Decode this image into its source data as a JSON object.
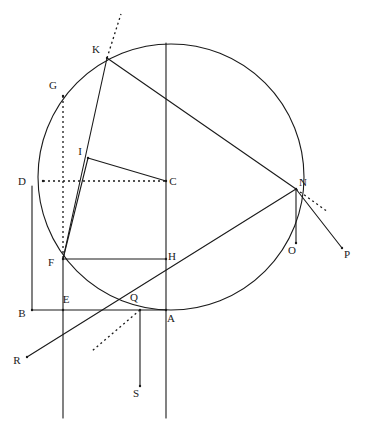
{
  "figure": {
    "width": 367,
    "height": 432,
    "background": "#ffffff",
    "stroke_color": "#1a1a1a",
    "label_color": "#1a1a1a",
    "stroke_width": 1.1
  },
  "circle": {
    "name": "main-circle",
    "cx": 171,
    "cy": 177,
    "r": 133
  },
  "points": [
    {
      "id": "A",
      "label": "A",
      "x": 166,
      "y": 310,
      "label_x": 171,
      "label_y": 322
    },
    {
      "id": "B",
      "label": "B",
      "x": 32,
      "y": 310,
      "label_x": 22,
      "label_y": 317
    },
    {
      "id": "C",
      "label": "C",
      "x": 166,
      "y": 181,
      "label_x": 173,
      "label_y": 185
    },
    {
      "id": "D",
      "label": "D",
      "x": 43,
      "y": 181,
      "label_x": 22,
      "label_y": 185
    },
    {
      "id": "E",
      "label": "E",
      "x": 63,
      "y": 310,
      "label_x": 66,
      "label_y": 303
    },
    {
      "id": "F",
      "label": "F",
      "x": 63,
      "y": 259,
      "label_x": 51,
      "label_y": 266
    },
    {
      "id": "G",
      "label": "G",
      "x": 63,
      "y": 96,
      "label_x": 53,
      "label_y": 89
    },
    {
      "id": "H",
      "label": "H",
      "x": 166,
      "y": 259,
      "label_x": 172,
      "label_y": 260
    },
    {
      "id": "I",
      "label": "I",
      "x": 88,
      "y": 158,
      "label_x": 80,
      "label_y": 155
    },
    {
      "id": "K",
      "label": "K",
      "x": 107,
      "y": 58,
      "label_x": 96,
      "label_y": 53
    },
    {
      "id": "N",
      "label": "N",
      "x": 296,
      "y": 189,
      "label_x": 303,
      "label_y": 186
    },
    {
      "id": "O",
      "label": "O",
      "x": 296,
      "y": 243,
      "label_x": 292,
      "label_y": 254
    },
    {
      "id": "P",
      "label": "P",
      "x": 342,
      "y": 248,
      "label_x": 347,
      "label_y": 258
    },
    {
      "id": "Q",
      "label": "Q",
      "x": 140,
      "y": 310,
      "label_x": 134,
      "label_y": 301
    },
    {
      "id": "R",
      "label": "R",
      "x": 27,
      "y": 357,
      "label_x": 17,
      "label_y": 364
    },
    {
      "id": "S",
      "label": "S",
      "x": 140,
      "y": 386,
      "label_x": 136,
      "label_y": 397
    }
  ],
  "solid_lines": [
    {
      "name": "line-vertical-CA",
      "x1": 166,
      "y1": 43,
      "x2": 166,
      "y2": 418
    },
    {
      "name": "line-vertical-GFE",
      "x1": 63,
      "y1": 259,
      "x2": 63,
      "y2": 418
    },
    {
      "name": "line-vertical-QS",
      "x1": 140,
      "y1": 310,
      "x2": 140,
      "y2": 386
    },
    {
      "name": "line-vertical-NO",
      "x1": 296,
      "y1": 189,
      "x2": 296,
      "y2": 243
    },
    {
      "name": "line-rect-left-DB",
      "x1": 32,
      "y1": 186,
      "x2": 32,
      "y2": 310
    },
    {
      "name": "line-rect-bottom-BA",
      "x1": 32,
      "y1": 310,
      "x2": 166,
      "y2": 310
    },
    {
      "name": "line-FH",
      "x1": 63,
      "y1": 259,
      "x2": 166,
      "y2": 259
    },
    {
      "name": "line-KF",
      "x1": 107,
      "y1": 58,
      "x2": 63,
      "y2": 259
    },
    {
      "name": "line-KN",
      "x1": 107,
      "y1": 58,
      "x2": 296,
      "y2": 189
    },
    {
      "name": "line-IC",
      "x1": 88,
      "y1": 158,
      "x2": 166,
      "y2": 181
    },
    {
      "name": "line-IF",
      "x1": 88,
      "y1": 158,
      "x2": 63,
      "y2": 259
    },
    {
      "name": "line-RN",
      "x1": 27,
      "y1": 357,
      "x2": 296,
      "y2": 189
    },
    {
      "name": "line-NP",
      "x1": 296,
      "y1": 189,
      "x2": 342,
      "y2": 248
    }
  ],
  "dotted_lines": [
    {
      "name": "dotted-tangent-K",
      "x1": 107,
      "y1": 58,
      "x2": 121,
      "y2": 14
    },
    {
      "name": "dotted-vertical-GF",
      "x1": 63,
      "y1": 96,
      "x2": 63,
      "y2": 259
    },
    {
      "name": "dotted-horizontal-DC",
      "x1": 43,
      "y1": 181,
      "x2": 166,
      "y2": 181
    },
    {
      "name": "dotted-tangent-Q",
      "x1": 140,
      "y1": 310,
      "x2": 92,
      "y2": 351
    },
    {
      "name": "dotted-tangent-N",
      "x1": 296,
      "y1": 189,
      "x2": 328,
      "y2": 212
    }
  ]
}
